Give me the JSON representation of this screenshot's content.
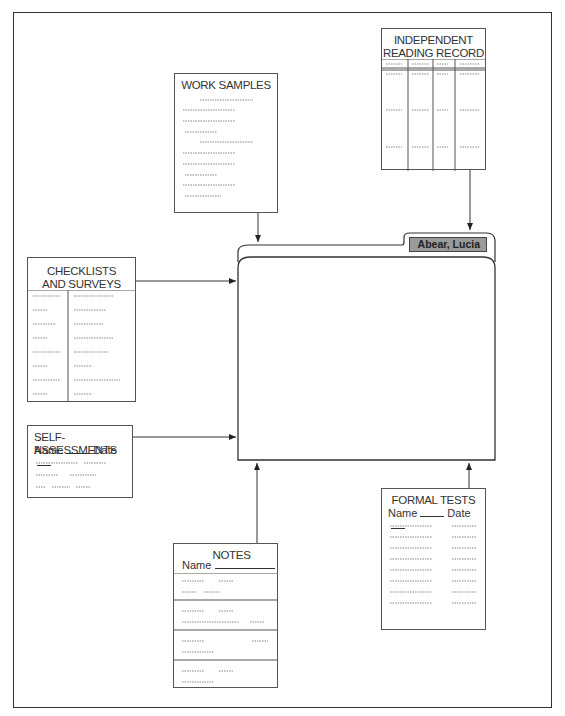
{
  "diagram": {
    "type": "portfolio-flow",
    "folder": {
      "label": "Abear, Lucia"
    },
    "documents": [
      {
        "id": "independent-reading-record",
        "title_lines": [
          "INDEPENDENT",
          "READING RECORD"
        ],
        "columns": 4,
        "rows": 3
      },
      {
        "id": "work-samples",
        "title_lines": [
          "WORK SAMPLES"
        ],
        "text_lines": 10
      },
      {
        "id": "checklists-and-surveys",
        "title_lines": [
          "CHECKLISTS",
          "AND SURVEYS"
        ],
        "columns": 2,
        "rows": 8
      },
      {
        "id": "self-assessments",
        "title_lines": [
          "SELF-ASSESSMENTS"
        ],
        "name_label": "Name",
        "date_label": "Date",
        "text_lines": 3
      },
      {
        "id": "notes",
        "title_lines": [
          "NOTES"
        ],
        "name_label": "Name",
        "sections": 4
      },
      {
        "id": "formal-tests",
        "title_lines": [
          "FORMAL TESTS"
        ],
        "name_label": "Name",
        "date_label": "Date",
        "rows": 8
      }
    ],
    "edges": [
      {
        "from": "independent-reading-record",
        "to": "folder"
      },
      {
        "from": "work-samples",
        "to": "folder"
      },
      {
        "from": "checklists-and-surveys",
        "to": "folder"
      },
      {
        "from": "self-assessments",
        "to": "folder"
      },
      {
        "from": "notes",
        "to": "folder"
      },
      {
        "from": "formal-tests",
        "to": "folder"
      }
    ]
  },
  "irr": {
    "title1": "INDEPENDENT",
    "title2": "READING RECORD"
  },
  "ws": {
    "title": "WORK SAMPLES"
  },
  "cs": {
    "title1": "CHECKLISTS",
    "title2": "AND SURVEYS"
  },
  "sa": {
    "title": "SELF-ASSESSMENTS",
    "name": "Name",
    "date": "Date"
  },
  "notes": {
    "title": "NOTES",
    "name": "Name"
  },
  "ft": {
    "title": "FORMAL TESTS",
    "name": "Name",
    "date": "Date"
  },
  "folder": {
    "label": "Abear, Lucia"
  }
}
